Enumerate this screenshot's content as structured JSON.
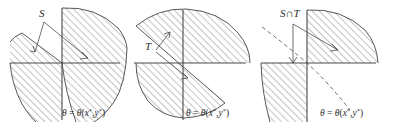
{
  "figure": {
    "type": "math-diagram-triptych",
    "background_color": "#ffffff",
    "line_color": "#4a4a4a",
    "hatch_color": "#808080"
  },
  "panels": [
    {
      "id": "panel-s",
      "set_label": "S",
      "curve_label": "θ = θ(x*, y*)",
      "curve_style": "solid",
      "shaded_regions": [
        "upper-left wedge",
        "right wedge",
        "lower-left wedge"
      ],
      "axes": {
        "x_axis": true,
        "y_axis": true,
        "origin_label": ""
      }
    },
    {
      "id": "panel-t",
      "set_label": "T",
      "curve_label": "θ = θ(x*, y*)",
      "curve_style": "solid",
      "shaded_regions": [
        "upper-right half-plane",
        "lower-left half-plane"
      ],
      "axes": {
        "x_axis": true,
        "y_axis": true,
        "origin_label": ""
      }
    },
    {
      "id": "panel-st",
      "set_label": "S∩T",
      "curve_label": "θ = θ(x*, y*)",
      "curve_style": "dashed",
      "shaded_regions": [
        "upper-right wedge",
        "lower-left wedge"
      ],
      "axes": {
        "x_axis": true,
        "y_axis": true,
        "origin_label": ""
      }
    }
  ],
  "labels": {
    "theta": "θ",
    "equals": "=",
    "x_star": "x",
    "y_star": "y",
    "star": "*",
    "open_paren": "(",
    "comma": ",",
    "close_paren": ")"
  }
}
